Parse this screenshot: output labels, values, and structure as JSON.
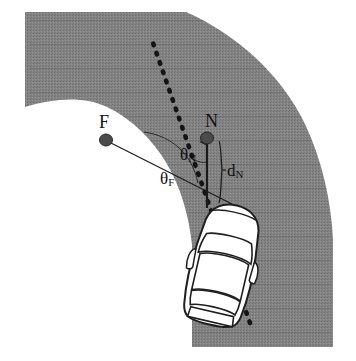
{
  "figure": {
    "kind": "road-curve-vehicle-geometry-diagram",
    "background_color": "#ffffff",
    "road_fill_color": "#808080",
    "ink_color": "#111111",
    "vehicle_body_color": "#ffffff",
    "width": 356,
    "height": 361
  },
  "labels": {
    "far_node": "F",
    "near_node": "N",
    "theta_near": {
      "base": "θ",
      "sub": "N"
    },
    "theta_far": {
      "base": "θ",
      "sub": "F"
    },
    "distance_near": {
      "base": "d",
      "sub": "N"
    }
  },
  "elements": {
    "road": {
      "name": "curved-road-band",
      "description": "gray curved road region bending from upper-left to lower-right"
    },
    "heading_line": {
      "name": "dotted-heading-line",
      "style": "dotted",
      "from": [
        249,
        321
      ],
      "to": [
        152,
        40
      ]
    },
    "near_arrow": {
      "name": "near-distance-arrow",
      "style": "solid-with-arrowhead",
      "from": [
        207,
        207
      ],
      "to": [
        207,
        134
      ]
    },
    "far_chord": {
      "name": "far-node-chord",
      "from": [
        107,
        140
      ],
      "to": [
        230,
        203
      ]
    },
    "angle_arc_far": {
      "name": "theta-far-arc"
    },
    "angle_arc_near": {
      "name": "theta-near-arc"
    },
    "brace_near": {
      "name": "d-near-brace"
    },
    "node_dots": [
      {
        "name": "far-node-dot",
        "label": "F",
        "cx": 106,
        "cy": 140
      },
      {
        "name": "near-node-dot",
        "label": "N",
        "cx": 208,
        "cy": 140
      }
    ],
    "vehicle": {
      "name": "vehicle-top-view",
      "rotation_deg": 13,
      "center": [
        223,
        265
      ]
    }
  },
  "label_positions": {
    "far_node": [
      104,
      117
    ],
    "near_node": [
      208,
      117
    ],
    "theta_near": [
      180,
      146
    ],
    "theta_far": [
      161,
      170
    ],
    "distance_near": [
      226,
      168
    ]
  }
}
